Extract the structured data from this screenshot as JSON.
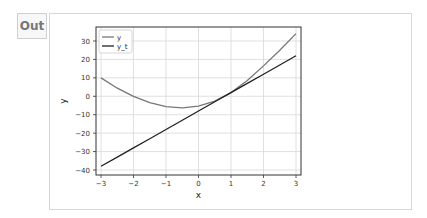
{
  "output": {
    "prompt_label": "Out"
  },
  "chart_data": {
    "type": "line",
    "title": "",
    "xlabel": "x",
    "ylabel": "y",
    "xlim": [
      -3.1,
      3.1
    ],
    "ylim": [
      -41,
      37
    ],
    "xticks": [
      -3,
      -2,
      -1,
      0,
      1,
      2,
      3
    ],
    "yticks": [
      -40,
      -30,
      -20,
      -10,
      0,
      10,
      20,
      30
    ],
    "grid": true,
    "legend_position": "upper left",
    "x": [
      -3,
      -2.5,
      -2,
      -1.5,
      -1,
      -0.5,
      0,
      0.5,
      1,
      1.5,
      2,
      2.5,
      3
    ],
    "series": [
      {
        "name": "y",
        "color": "#777777",
        "values": [
          10,
          4.4,
          0,
          -3.4,
          -5.6,
          -6.3,
          -5.4,
          -2.6,
          2,
          8.5,
          16.5,
          25,
          34
        ]
      },
      {
        "name": "y_t",
        "color": "#222222",
        "values": [
          -38,
          -33,
          -28,
          -23,
          -18,
          -13,
          -8,
          -3,
          2,
          7,
          12,
          17,
          22
        ]
      }
    ]
  }
}
